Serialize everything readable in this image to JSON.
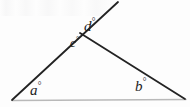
{
  "figure": {
    "background_color": "#fdfdfd",
    "line_color": "#232323",
    "baseline_color": "#b9b9b9",
    "label_color": "#1c1c1c",
    "degree_symbol": "°",
    "labels": {
      "a": "a",
      "b": "b",
      "c": "c",
      "d": "d"
    },
    "geometry": {
      "vertex_left": [
        12,
        100
      ],
      "vertex_right": [
        185,
        99
      ],
      "vertex_top": [
        80,
        33
      ],
      "ray_tip": [
        118,
        2
      ]
    }
  }
}
